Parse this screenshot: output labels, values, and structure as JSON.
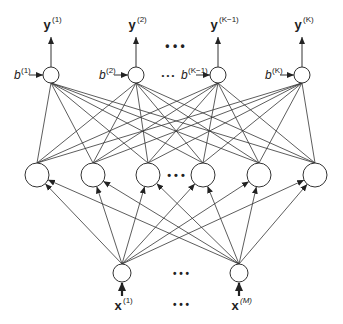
{
  "diagram": {
    "type": "neural-network",
    "colors": {
      "line": "#333333",
      "node_fill": "#ffffff",
      "background": "#ffffff",
      "text": "#222222"
    },
    "output_layer": {
      "nodes": [
        {
          "x": 51,
          "y": 75,
          "output_label": "y",
          "output_sup": "(1)",
          "bias_label": "b",
          "bias_sup": "(1)"
        },
        {
          "x": 136,
          "y": 75,
          "output_label": "y",
          "output_sup": "(2)",
          "bias_label": "b",
          "bias_sup": "(2)"
        },
        {
          "x": 218,
          "y": 75,
          "output_label": "y",
          "output_sup": "(K−1)",
          "bias_label": "b",
          "bias_sup": "(K−1)"
        },
        {
          "x": 302,
          "y": 75,
          "output_label": "y",
          "output_sup": "(K)",
          "bias_label": "b",
          "bias_sup": "(K)"
        }
      ],
      "ellipsis_top": "• • •",
      "ellipsis_bias": "• • •"
    },
    "hidden_layer": {
      "nodes": [
        {
          "x": 37,
          "y": 175
        },
        {
          "x": 93,
          "y": 175
        },
        {
          "x": 148,
          "y": 175
        },
        {
          "x": 203,
          "y": 175
        },
        {
          "x": 259,
          "y": 175
        },
        {
          "x": 315,
          "y": 175
        }
      ],
      "ellipsis": "• • •"
    },
    "input_layer": {
      "nodes": [
        {
          "x": 122,
          "y": 273,
          "label": "x",
          "sup": "(1)"
        },
        {
          "x": 239,
          "y": 273,
          "label": "x",
          "sup": "(M)"
        }
      ],
      "ellipsis_nodes": "• • •",
      "ellipsis_labels": "• • •"
    }
  }
}
